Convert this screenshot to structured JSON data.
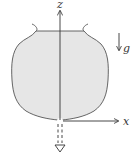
{
  "diagram": {
    "axes": {
      "z_label": "z",
      "x_label": "x"
    },
    "gravity_label": "g",
    "colors": {
      "fill": "#e6e6e6",
      "stroke": "#555555",
      "axis": "#333333"
    }
  }
}
